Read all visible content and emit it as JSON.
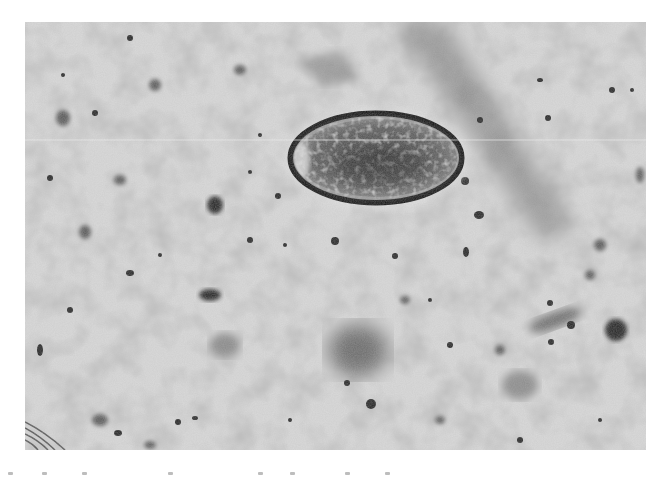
{
  "image": {
    "kind": "light micrograph (grayscale)",
    "subject": "oval parasite egg with thick smooth shell and granular contents",
    "background": "speckled light-gray field with scattered dark debris particles",
    "features": [
      {
        "name": "oval-egg",
        "center": [
          376,
          158
        ],
        "radius": [
          87,
          46
        ]
      },
      {
        "name": "diagonal-dark-band",
        "from": [
          400,
          22
        ],
        "to": [
          560,
          235
        ]
      },
      {
        "name": "blurred-dark-smudge",
        "center": [
          360,
          350
        ]
      },
      {
        "name": "dark-particle-left",
        "center": [
          215,
          205
        ]
      },
      {
        "name": "dark-particle-lower-left",
        "center": [
          210,
          295
        ]
      },
      {
        "name": "dark-particle-right",
        "center": [
          616,
          330
        ]
      },
      {
        "name": "fibrous-swirl-bottom-left",
        "center": [
          40,
          440
        ]
      }
    ],
    "frame": {
      "left": 25,
      "top": 22,
      "width": 621,
      "height": 428
    },
    "colors": {
      "background_field": "#d6d6d6",
      "debris": "#2a2a2a",
      "egg_shell": "#1e1e1e",
      "egg_interior": "#5a5a5a",
      "page": "#ffffff"
    }
  },
  "caption": {
    "note": "Caption text at bottom edge is cropped and illegible"
  }
}
